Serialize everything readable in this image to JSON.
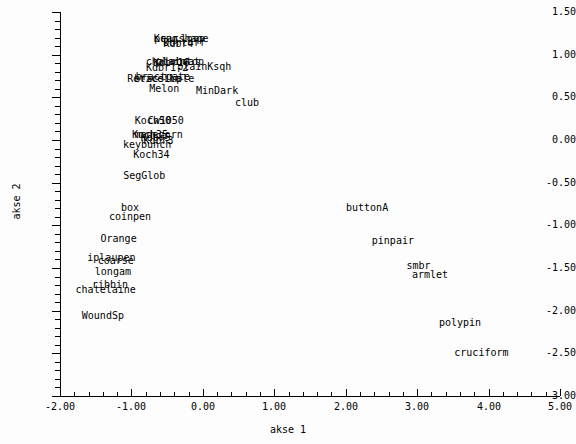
{
  "chart_data": {
    "type": "scatter",
    "title": "",
    "xlabel": "akse 1",
    "ylabel": "akse 2",
    "xlim": [
      -2.0,
      5.0
    ],
    "ylim": [
      -3.0,
      1.5
    ],
    "grid": false,
    "legend": "none",
    "point_marker": "text-label",
    "xticks": [
      "-2.00",
      "-1.00",
      "0.00",
      "1.00",
      "2.00",
      "3.00",
      "4.00",
      "5.00"
    ],
    "xtick_values": [
      -2.0,
      -1.0,
      0.0,
      1.0,
      2.0,
      3.0,
      4.0,
      5.0
    ],
    "yticks": [
      "1.50",
      "1.00",
      "0.50",
      "0.00",
      "-0.50",
      "-1.00",
      "-1.50",
      "-2.00",
      "-2.50",
      "-3.00"
    ],
    "ytick_values": [
      1.5,
      1.0,
      0.5,
      0.0,
      -0.5,
      -1.0,
      -1.5,
      -2.0,
      -2.5,
      -3.0
    ],
    "minor_tick_step": 0.1,
    "points": [
      {
        "label": "Krug",
        "x": -0.52,
        "y": 1.19
      },
      {
        "label": "pearshape",
        "x": -0.3,
        "y": 1.19
      },
      {
        "label": "Dortoff",
        "x": -0.26,
        "y": 1.14
      },
      {
        "label": "loop",
        "x": -0.14,
        "y": 1.18
      },
      {
        "label": "Kdbr4",
        "x": -0.34,
        "y": 1.13
      },
      {
        "label": "chainboat",
        "x": -0.42,
        "y": 0.92
      },
      {
        "label": "Kdbr16",
        "x": -0.44,
        "y": 0.9
      },
      {
        "label": "plaintop",
        "x": -0.32,
        "y": 0.91
      },
      {
        "label": "plainKsqh",
        "x": 0.02,
        "y": 0.86
      },
      {
        "label": "Kdbr1-2",
        "x": -0.5,
        "y": 0.84
      },
      {
        "label": "bractgate",
        "x": -0.56,
        "y": 0.74
      },
      {
        "label": "Reticella",
        "x": -0.68,
        "y": 0.71
      },
      {
        "label": "bracsimple",
        "x": -0.54,
        "y": 0.72
      },
      {
        "label": "Melon",
        "x": -0.54,
        "y": 0.6
      },
      {
        "label": "MinDark",
        "x": 0.2,
        "y": 0.58
      },
      {
        "label": "club",
        "x": 0.62,
        "y": 0.44
      },
      {
        "label": "Koch50",
        "x": -0.7,
        "y": 0.22
      },
      {
        "label": "Cw1050",
        "x": -0.52,
        "y": 0.22
      },
      {
        "label": "Koch35",
        "x": -0.74,
        "y": 0.06
      },
      {
        "label": "madegorn",
        "x": -0.62,
        "y": 0.06
      },
      {
        "label": "Kdbr5",
        "x": -0.66,
        "y": 0.02
      },
      {
        "label": "Kdbr3",
        "x": -0.62,
        "y": -0.01
      },
      {
        "label": "keybunch",
        "x": -0.78,
        "y": -0.06
      },
      {
        "label": "Koch34",
        "x": -0.72,
        "y": -0.18
      },
      {
        "label": "SegGlob",
        "x": -0.82,
        "y": -0.42
      },
      {
        "label": "box",
        "x": -1.02,
        "y": -0.8
      },
      {
        "label": "coinpen",
        "x": -1.02,
        "y": -0.9
      },
      {
        "label": "buttonA",
        "x": 2.3,
        "y": -0.8
      },
      {
        "label": "Orange",
        "x": -1.18,
        "y": -1.16
      },
      {
        "label": "pinpair",
        "x": 2.66,
        "y": -1.18
      },
      {
        "label": "iplaupen",
        "x": -1.28,
        "y": -1.38
      },
      {
        "label": "coarse",
        "x": -1.22,
        "y": -1.42
      },
      {
        "label": "longam",
        "x": -1.26,
        "y": -1.55
      },
      {
        "label": "smbr",
        "x": 3.02,
        "y": -1.48
      },
      {
        "label": "armlet",
        "x": 3.18,
        "y": -1.58
      },
      {
        "label": "ribbin",
        "x": -1.3,
        "y": -1.7
      },
      {
        "label": "chatelaine",
        "x": -1.36,
        "y": -1.76
      },
      {
        "label": "WoundSp",
        "x": -1.4,
        "y": -2.06
      },
      {
        "label": "polypin",
        "x": 3.6,
        "y": -2.14
      },
      {
        "label": "cruciform",
        "x": 3.9,
        "y": -2.5
      }
    ]
  }
}
